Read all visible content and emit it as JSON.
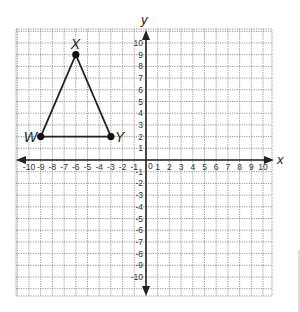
{
  "graph": {
    "axes": {
      "x_label": "x",
      "y_label": "y",
      "x_range": [
        -10,
        10
      ],
      "y_range": [
        -10,
        10
      ],
      "x_ticks": [
        "-10",
        "-9",
        "-8",
        "-7",
        "-6",
        "-5",
        "-4",
        "-3",
        "-2",
        "-1",
        "1",
        "2",
        "3",
        "4",
        "5",
        "6",
        "7",
        "8",
        "9",
        "10"
      ],
      "y_ticks": [
        "10",
        "9",
        "8",
        "7",
        "6",
        "5",
        "4",
        "3",
        "2",
        "1",
        "-1",
        "-2",
        "-3",
        "-4",
        "-5",
        "-6",
        "-7",
        "-8",
        "-9",
        "-10"
      ],
      "origin_label": "0"
    },
    "triangle": {
      "vertices": [
        {
          "name": "W",
          "x": -9,
          "y": 2
        },
        {
          "name": "X",
          "x": -6,
          "y": 9
        },
        {
          "name": "Y",
          "x": -3,
          "y": 2
        }
      ]
    },
    "colors": {
      "axis": "#222222",
      "grid": "#777777",
      "shape": "#222222"
    }
  }
}
